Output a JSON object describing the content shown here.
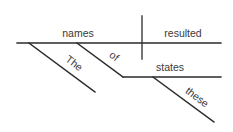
{
  "diagram": {
    "type": "sentence-diagram",
    "sentence_words": [
      "The",
      "names",
      "of",
      "these",
      "states",
      "resulted"
    ],
    "subject": "names",
    "verb": "resulted",
    "modifiers": {
      "article": "The",
      "preposition": "of",
      "prepositional_object": "states",
      "object_modifier": "these"
    },
    "line_color": "#2a2a2a",
    "text_color": "#3a3a3a"
  }
}
